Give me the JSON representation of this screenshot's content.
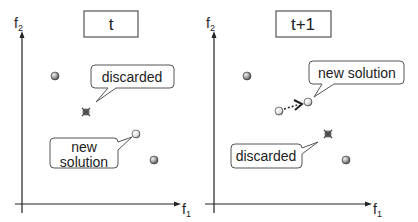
{
  "panels": [
    {
      "title": "t",
      "y_axis_label": "f",
      "y_axis_sub": "2",
      "x_axis_label": "f",
      "x_axis_sub": "1",
      "callouts": [
        {
          "id": "discarded",
          "text": "discarded"
        },
        {
          "id": "new_solution_line1",
          "text": "new"
        },
        {
          "id": "new_solution_line2",
          "text": "solution"
        }
      ]
    },
    {
      "title": "t+1",
      "y_axis_label": "f",
      "y_axis_sub": "2",
      "x_axis_label": "f",
      "x_axis_sub": "1",
      "callouts": [
        {
          "id": "new_solution",
          "text": "new solution"
        },
        {
          "id": "discarded",
          "text": "discarded"
        }
      ]
    }
  ],
  "colors": {
    "axis": "#222222",
    "point_fill": "#9a9a9a",
    "point_stroke": "#333333",
    "new_point_fill": "#e8e8e8",
    "discarded": "#555555",
    "bubble_stroke": "#555555"
  }
}
